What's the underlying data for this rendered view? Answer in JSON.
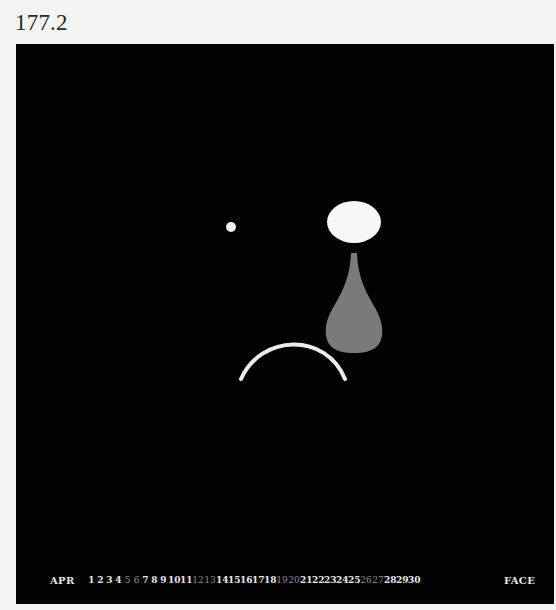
{
  "plate": {
    "number": "177.2"
  },
  "figure": {
    "background_color": "#020202",
    "shapes": {
      "left_eye": {
        "type": "dot",
        "cx": 215,
        "cy": 183,
        "r": 5,
        "color": "#f2f2f0"
      },
      "right_eye": {
        "type": "ellipse",
        "cx": 338,
        "cy": 178,
        "rx": 27,
        "ry": 21,
        "color": "#f7f7f5"
      },
      "tear": {
        "type": "teardrop",
        "color": "#7a7a7a"
      },
      "mouth": {
        "type": "arc-frown",
        "color": "#ececea"
      }
    }
  },
  "caption": {
    "month": "APR",
    "days": [
      {
        "n": "1",
        "dim": false
      },
      {
        "n": "2",
        "dim": false
      },
      {
        "n": "3",
        "dim": false
      },
      {
        "n": "4",
        "dim": false
      },
      {
        "n": "5",
        "dim": true
      },
      {
        "n": "6",
        "dim": true
      },
      {
        "n": "7",
        "dim": false
      },
      {
        "n": "8",
        "dim": false
      },
      {
        "n": "9",
        "dim": false
      },
      {
        "n": "10",
        "dim": false
      },
      {
        "n": "11",
        "dim": false
      },
      {
        "n": "12",
        "dim": true
      },
      {
        "n": "13",
        "dim": true
      },
      {
        "n": "14",
        "dim": false
      },
      {
        "n": "15",
        "dim": false
      },
      {
        "n": "16",
        "dim": false
      },
      {
        "n": "17",
        "dim": false
      },
      {
        "n": "18",
        "dim": false
      },
      {
        "n": "19",
        "dim": true
      },
      {
        "n": "20",
        "dim": true
      },
      {
        "n": "21",
        "dim": false
      },
      {
        "n": "22",
        "dim": false
      },
      {
        "n": "23",
        "dim": false
      },
      {
        "n": "24",
        "dim": false
      },
      {
        "n": "25",
        "dim": false
      },
      {
        "n": "26",
        "dim": true
      },
      {
        "n": "27",
        "dim": true
      },
      {
        "n": "28",
        "dim": false
      },
      {
        "n": "29",
        "dim": false
      },
      {
        "n": "30",
        "dim": false
      }
    ],
    "label": "FACE"
  }
}
